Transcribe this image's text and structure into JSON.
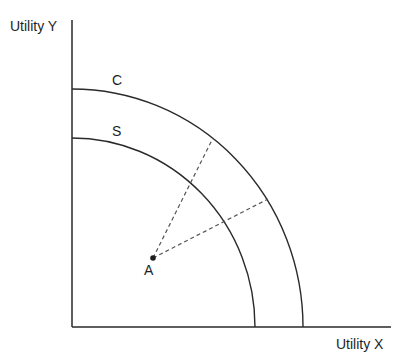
{
  "diagram": {
    "y_axis_label": "Utility Y",
    "x_axis_label": "Utility X",
    "curves": [
      {
        "label": "C",
        "description": "outer utility possibility frontier"
      },
      {
        "label": "S",
        "description": "inner utility possibility frontier"
      }
    ],
    "point": {
      "label": "A"
    },
    "colors": {
      "line": "#2a2a2a",
      "dashed": "#555555",
      "text": "#1e1e1e"
    }
  }
}
